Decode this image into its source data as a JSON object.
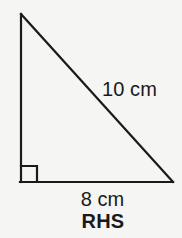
{
  "figure": {
    "background_color": "#f5f5f4",
    "stroke_color": "#1a1a1a",
    "text_color": "#1a1a1a",
    "shape": "right-triangle",
    "caption": "RHS",
    "labels": {
      "hypotenuse": "10 cm",
      "base": "8 cm"
    },
    "measurements": {
      "hypotenuse_value": 10,
      "hypotenuse_unit": "cm",
      "base_value": 8,
      "base_unit": "cm"
    },
    "right_angle_marker": {
      "name": "right-angle-square",
      "vertex": "bottom-left",
      "size_px": 16
    },
    "vertices": {
      "apex": [
        21,
        14
      ],
      "bottom_left": [
        21,
        182
      ],
      "bottom_right": [
        173,
        182
      ]
    }
  }
}
